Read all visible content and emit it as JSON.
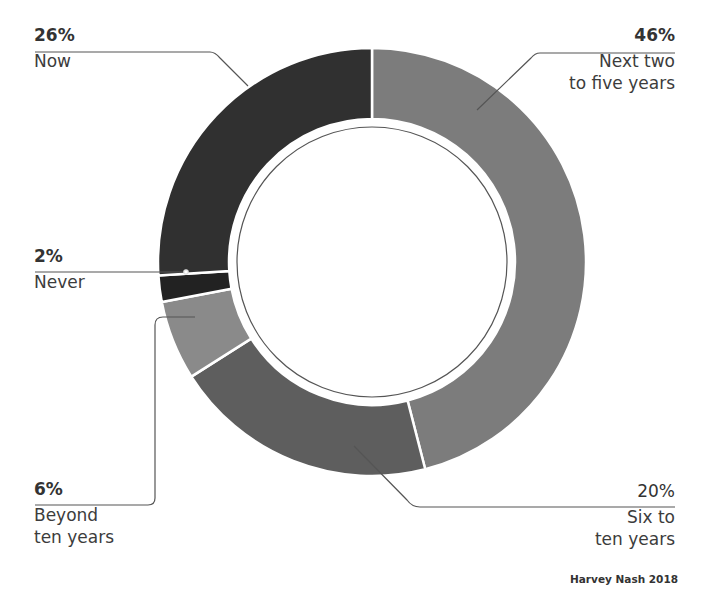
{
  "chart_data": {
    "type": "pie",
    "variant": "donut",
    "title": "",
    "categories": [
      "Next two to five years",
      "Six to ten years",
      "Beyond ten years",
      "Never",
      "Now"
    ],
    "values": [
      46,
      20,
      6,
      2,
      26
    ],
    "unit": "%",
    "start_angle_deg": 0,
    "direction": "clockwise",
    "colors": [
      "#7c7c7c",
      "#5e5e5e",
      "#8a8a8a",
      "#222222",
      "#303030"
    ],
    "legend": "none (callout labels)",
    "source": "Harvey Nash 2018"
  },
  "labels": {
    "now": {
      "pct": "26%",
      "text": "Now"
    },
    "next": {
      "pct": "46%",
      "text": "Next two\nto five years"
    },
    "never": {
      "pct": "2%",
      "text": "Never"
    },
    "beyond": {
      "pct": "6%",
      "text": "Beyond\nten years"
    },
    "six": {
      "pct": "20%",
      "text": "Six to\nten years"
    }
  },
  "footer": {
    "source": "Harvey Nash 2018"
  }
}
